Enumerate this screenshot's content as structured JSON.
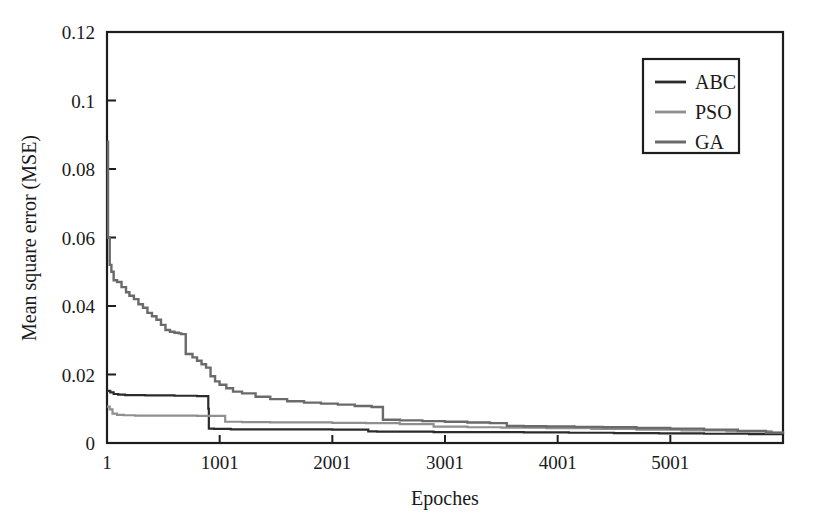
{
  "chart_data": {
    "type": "line",
    "title": "",
    "xlabel": "Epoches",
    "ylabel": "Mean square error (MSE)",
    "xlim": [
      1,
      6001
    ],
    "ylim": [
      0,
      0.12
    ],
    "grid": false,
    "legend_position": "top-right",
    "x_ticks": [
      1,
      1001,
      2001,
      3001,
      4001,
      5001
    ],
    "x_tick_labels": [
      "1",
      "1001",
      "2001",
      "3001",
      "4001",
      "5001"
    ],
    "y_ticks": [
      0,
      0.02,
      0.04,
      0.06,
      0.08,
      0.1,
      0.12
    ],
    "y_tick_labels": [
      "0",
      "0.02",
      "0.04",
      "0.06",
      "0.08",
      "0.1",
      "0.12"
    ],
    "series": [
      {
        "name": "ABC",
        "color": "#2b2b2b",
        "width": 2.2,
        "x": [
          1,
          30,
          60,
          100,
          160,
          240,
          340,
          470,
          600,
          700,
          800,
          880,
          900,
          905,
          950,
          1020,
          1100,
          1250,
          1450,
          1700,
          2000,
          2250,
          2320,
          2400,
          2600,
          2900,
          3300,
          3700,
          4100,
          4500,
          4900,
          5300,
          5700,
          6001
        ],
        "y": [
          0.0152,
          0.0148,
          0.0143,
          0.0141,
          0.014,
          0.014,
          0.0139,
          0.0139,
          0.0138,
          0.0138,
          0.0137,
          0.0137,
          0.01,
          0.0042,
          0.0041,
          0.0041,
          0.004,
          0.004,
          0.004,
          0.004,
          0.0039,
          0.0039,
          0.0034,
          0.0033,
          0.0033,
          0.0032,
          0.0032,
          0.0031,
          0.003,
          0.0029,
          0.0028,
          0.0027,
          0.0026,
          0.0025
        ]
      },
      {
        "name": "PSO",
        "color": "#8f8f8f",
        "width": 2.2,
        "x": [
          1,
          25,
          50,
          90,
          150,
          250,
          400,
          600,
          800,
          950,
          1050,
          1200,
          1450,
          1700,
          2000,
          2300,
          2600,
          2900,
          3200,
          3500,
          3900,
          4300,
          4700,
          5100,
          5500,
          5900,
          6001
        ],
        "y": [
          0.0106,
          0.0098,
          0.0086,
          0.0082,
          0.0081,
          0.008,
          0.008,
          0.008,
          0.0079,
          0.0079,
          0.0062,
          0.0061,
          0.006,
          0.006,
          0.0059,
          0.0058,
          0.0055,
          0.0048,
          0.0046,
          0.0045,
          0.0043,
          0.0041,
          0.0039,
          0.0037,
          0.0034,
          0.003,
          0.0029
        ]
      },
      {
        "name": "GA",
        "color": "#6a6a6a",
        "width": 2.4,
        "x": [
          1,
          10,
          25,
          40,
          60,
          90,
          130,
          170,
          200,
          240,
          280,
          320,
          360,
          400,
          440,
          480,
          520,
          560,
          600,
          640,
          660,
          700,
          760,
          800,
          840,
          880,
          920,
          960,
          1000,
          1060,
          1120,
          1200,
          1320,
          1450,
          1600,
          1750,
          1900,
          2050,
          2200,
          2350,
          2450,
          2600,
          2800,
          3000,
          3200,
          3400,
          3550,
          3700,
          3900,
          4150,
          4400,
          4700,
          5000,
          5300,
          5600,
          5850,
          6001
        ],
        "y": [
          0.088,
          0.06,
          0.052,
          0.05,
          0.0475,
          0.047,
          0.0455,
          0.044,
          0.043,
          0.042,
          0.0405,
          0.0395,
          0.038,
          0.037,
          0.036,
          0.0345,
          0.033,
          0.0325,
          0.0322,
          0.032,
          0.0318,
          0.026,
          0.025,
          0.024,
          0.023,
          0.022,
          0.0195,
          0.018,
          0.017,
          0.016,
          0.015,
          0.0145,
          0.0135,
          0.0128,
          0.0122,
          0.0118,
          0.0115,
          0.0112,
          0.0108,
          0.0105,
          0.0068,
          0.0066,
          0.0064,
          0.0062,
          0.006,
          0.0058,
          0.005,
          0.0049,
          0.0048,
          0.0047,
          0.0046,
          0.0044,
          0.0042,
          0.0039,
          0.0035,
          0.003,
          0.0028
        ]
      }
    ]
  },
  "legend": {
    "entries": [
      {
        "label": "ABC"
      },
      {
        "label": "PSO"
      },
      {
        "label": "GA"
      }
    ]
  }
}
